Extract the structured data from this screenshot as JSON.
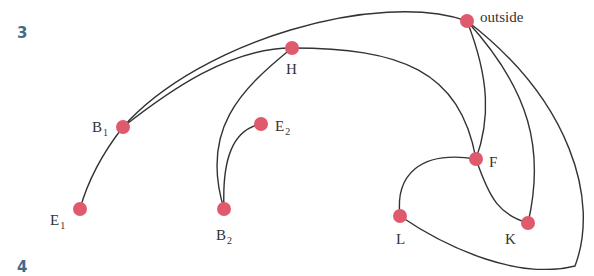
{
  "page": {
    "cut_off_text": "diagram continued from above",
    "markers": {
      "top": "3",
      "bottom": "4"
    }
  },
  "diagram": {
    "type": "graph",
    "node_color": "#e05a6e",
    "edge_color": "#333333",
    "nodes": [
      {
        "id": "outside",
        "label": "outside",
        "x": 467,
        "y": 21
      },
      {
        "id": "H",
        "label": "H",
        "x": 292,
        "y": 48
      },
      {
        "id": "B1",
        "label": "B",
        "sub": "1",
        "x": 123,
        "y": 127
      },
      {
        "id": "E2",
        "label": "E",
        "sub": "2",
        "x": 261,
        "y": 124
      },
      {
        "id": "F",
        "label": "F",
        "x": 476,
        "y": 159
      },
      {
        "id": "E1",
        "label": "E",
        "sub": "1",
        "x": 80,
        "y": 209
      },
      {
        "id": "B2",
        "label": "B",
        "sub": "2",
        "x": 224,
        "y": 209
      },
      {
        "id": "L",
        "label": "L",
        "x": 400,
        "y": 216
      },
      {
        "id": "K",
        "label": "K",
        "x": 528,
        "y": 223
      }
    ],
    "edges": [
      [
        "B1",
        "outside"
      ],
      [
        "B1",
        "H"
      ],
      [
        "B1",
        "E1"
      ],
      [
        "H",
        "B2"
      ],
      [
        "H",
        "F"
      ],
      [
        "E2",
        "B2"
      ],
      [
        "outside",
        "F"
      ],
      [
        "outside",
        "K"
      ],
      [
        "outside",
        "L"
      ],
      [
        "F",
        "L"
      ],
      [
        "F",
        "K"
      ]
    ]
  }
}
